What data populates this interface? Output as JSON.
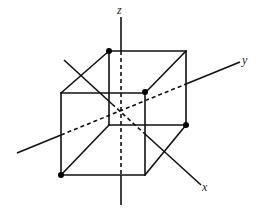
{
  "figure": {
    "axes": {
      "x": {
        "label": "x"
      },
      "y": {
        "label": "y"
      },
      "z": {
        "label": "z"
      }
    },
    "marked_vertices": 4,
    "colors": {
      "line": "#111111",
      "background": "#ffffff"
    }
  }
}
